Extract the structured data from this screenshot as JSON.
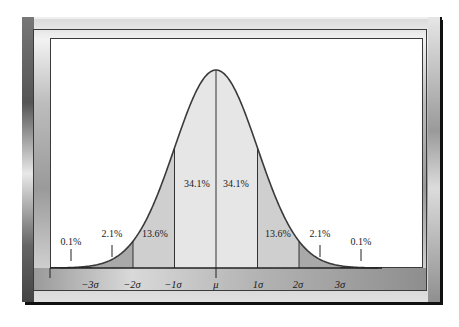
{
  "chart_data": {
    "type": "area",
    "title": "",
    "xlabel": "",
    "ylabel": "",
    "x_tick_labels": [
      "−3σ",
      "−2σ",
      "−1σ",
      "μ",
      "1σ",
      "2σ",
      "3σ"
    ],
    "x_tick_values": [
      -3,
      -2,
      -1,
      0,
      1,
      2,
      3
    ],
    "regions": [
      {
        "range": "below −3σ",
        "label": "0.1%",
        "percent": 0.1
      },
      {
        "range": "−3σ to −2σ",
        "label": "2.1%",
        "percent": 2.1
      },
      {
        "range": "−2σ to −1σ",
        "label": "13.6%",
        "percent": 13.6
      },
      {
        "range": "−1σ to μ",
        "label": "34.1%",
        "percent": 34.1
      },
      {
        "range": "μ to 1σ",
        "label": "34.1%",
        "percent": 34.1
      },
      {
        "range": "1σ to 2σ",
        "label": "13.6%",
        "percent": 13.6
      },
      {
        "range": "2σ to 3σ",
        "label": "2.1%",
        "percent": 2.1
      },
      {
        "range": "above 3σ",
        "label": "0.1%",
        "percent": 0.1
      }
    ],
    "shading": {
      "center": "#e6e6e6",
      "one_to_two_sigma": "#cfcfcf",
      "two_to_three_sigma": "#a9a9a9"
    },
    "grid": false,
    "legend": null
  },
  "labels": {
    "tail_left": "0.1%",
    "two_left": "2.1%",
    "thirteen_left": "13.6%",
    "center_left": "34.1%",
    "center_right": "34.1%",
    "thirteen_right": "13.6%",
    "two_right": "2.1%",
    "tail_right": "0.1%"
  },
  "axis": {
    "neg3": "−3σ",
    "neg2": "−2σ",
    "neg1": "−1σ",
    "mu": "μ",
    "pos1": "1σ",
    "pos2": "2σ",
    "pos3": "3σ"
  }
}
